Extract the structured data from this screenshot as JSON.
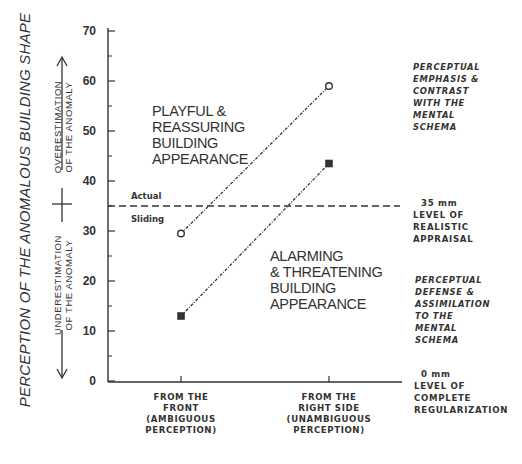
{
  "chart_data": {
    "type": "line",
    "title": "",
    "ylabel": "PERCEPTION OF THE ANOMALOUS  BUILDING SHAPE",
    "ylabel_upper": [
      "OVERESTIMATION",
      "OF THE ANOMALY"
    ],
    "ylabel_lower": [
      "UNDERESTIMATION",
      "OF THE ANOMALY"
    ],
    "ylim": [
      0,
      70
    ],
    "yticks": [
      0,
      10,
      20,
      30,
      40,
      50,
      60,
      70
    ],
    "categories": [
      [
        "FROM THE",
        "FRONT",
        "(AMBIGUOUS",
        "PERCEPTION)"
      ],
      [
        "FROM THE",
        "RIGHT SIDE",
        "(UNAMBIGUOUS",
        "PERCEPTION)"
      ]
    ],
    "series": [
      {
        "name": "Sliding",
        "marker": "open-circle",
        "values": [
          29.5,
          59
        ]
      },
      {
        "name": "Actual",
        "marker": "filled-square",
        "values": [
          13,
          43.5
        ]
      }
    ],
    "reference_line": {
      "value": 35,
      "style": "dashed",
      "label_above": "Actual",
      "label_below": "Sliding"
    },
    "annotations": {
      "upper_region": [
        "PLAYFUL &",
        "REASSURING",
        "BUILDING",
        "APPEARANCE"
      ],
      "lower_region": [
        "ALARMING",
        "& THREATENING",
        "BUILDING",
        "APPEARANCE"
      ],
      "right_upper": [
        "PERCEPTUAL",
        "EMPHASIS &",
        "CONTRAST",
        "WITH THE",
        "MENTAL",
        "SCHEMA"
      ],
      "right_mid": [
        "35 mm",
        "LEVEL OF",
        "REALISTIC",
        "APPRAISAL"
      ],
      "right_lower": [
        "PERCEPTUAL",
        "DEFENSE &",
        "ASSIMILATION",
        "TO THE",
        "MENTAL",
        "SCHEMA"
      ],
      "right_bottom": [
        "0 mm",
        "LEVEL OF",
        "COMPLETE",
        "REGULARIZATION"
      ]
    },
    "grid": false,
    "legend": "none"
  }
}
